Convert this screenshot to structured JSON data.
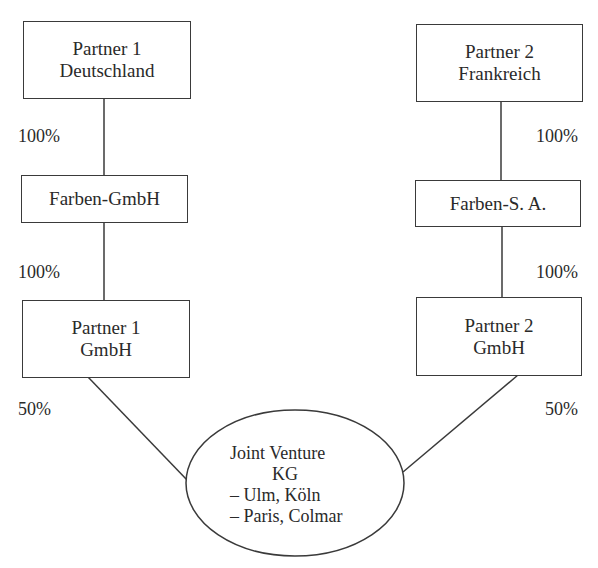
{
  "diagram": {
    "left_chain": {
      "top": {
        "line1": "Partner 1",
        "line2": "Deutschland"
      },
      "middle": {
        "label": "Farben-GmbH"
      },
      "bottom": {
        "line1": "Partner 1",
        "line2": "GmbH"
      },
      "share_top": "100%",
      "share_middle": "100%",
      "share_jv": "50%"
    },
    "right_chain": {
      "top": {
        "line1": "Partner 2",
        "line2": "Frankreich"
      },
      "middle": {
        "label": "Farben-S. A."
      },
      "bottom": {
        "line1": "Partner 2",
        "line2": "GmbH"
      },
      "share_top": "100%",
      "share_middle": "100%",
      "share_jv": "50%"
    },
    "joint_venture": {
      "line1": "Joint Venture",
      "line2": "KG",
      "line3": "– Ulm, Köln",
      "line4": "– Paris, Colmar"
    }
  }
}
